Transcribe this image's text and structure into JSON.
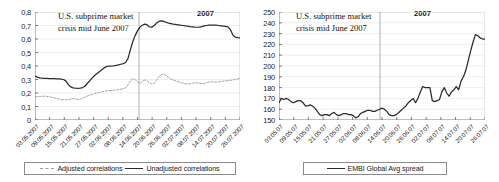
{
  "figure": {
    "panels": [
      {
        "id": "left",
        "annotation_line1": "U.S. subprime market",
        "annotation_line2": "crisis mid June 2007",
        "year_label": "2007",
        "legend": [
          {
            "label": "Adjusted correlations",
            "style": "dashed",
            "color": "#9b9b9b"
          },
          {
            "label": "Unadjusted correlations",
            "style": "solid",
            "color": "#2b2b2b"
          }
        ]
      },
      {
        "id": "right",
        "annotation_line1": "U.S. subprime market",
        "annotation_line2": "crisis mid June 2007",
        "year_label": "2007",
        "legend": [
          {
            "label": "EMBI Global Avg spread",
            "style": "solid",
            "color": "#2b2b2b"
          }
        ]
      }
    ]
  },
  "chart_data": [
    {
      "type": "line",
      "id": "correlations",
      "title": "",
      "xlabel": "",
      "ylabel": "",
      "ylim": [
        0,
        0.8
      ],
      "yticks": [
        0,
        0.1,
        0.2,
        0.3,
        0.4,
        0.5,
        0.6,
        0.7,
        0.8
      ],
      "ytick_labels": [
        "0",
        "0,1",
        "0,2",
        "0,3",
        "0,4",
        "0,5",
        "0,6",
        "0,7",
        "0,8"
      ],
      "grid": true,
      "legend_position": "bottom",
      "annotations": [
        {
          "text": "U.S. subprime market crisis mid June 2007",
          "type": "text"
        },
        {
          "text": "2007",
          "type": "year"
        },
        {
          "type": "vline",
          "at": "18.06.2007"
        }
      ],
      "xtick_labels": [
        "03.05.2007",
        "09.05.2007",
        "15.05.2007",
        "21.05.2007",
        "27.05.2007",
        "02.06.2007",
        "08.06.2007",
        "14.06.2007",
        "20.06.2007",
        "26.06.2007",
        "02.07.2007",
        "08.07.2007",
        "14.07.2007",
        "20.07.2007",
        "26.07.2007"
      ],
      "series": [
        {
          "name": "Unadjusted correlations",
          "color": "#2b2b2b",
          "style": "solid",
          "values": [
            0.325,
            0.318,
            0.312,
            0.31,
            0.309,
            0.308,
            0.307,
            0.306,
            0.306,
            0.305,
            0.304,
            0.303,
            0.3,
            0.288,
            0.262,
            0.245,
            0.238,
            0.236,
            0.235,
            0.236,
            0.24,
            0.252,
            0.272,
            0.292,
            0.312,
            0.33,
            0.345,
            0.358,
            0.372,
            0.386,
            0.396,
            0.4,
            0.4,
            0.401,
            0.404,
            0.408,
            0.413,
            0.418,
            0.426,
            0.455,
            0.52,
            0.58,
            0.625,
            0.66,
            0.688,
            0.702,
            0.71,
            0.706,
            0.69,
            0.688,
            0.7,
            0.718,
            0.73,
            0.734,
            0.73,
            0.724,
            0.718,
            0.714,
            0.71,
            0.708,
            0.705,
            0.702,
            0.7,
            0.697,
            0.695,
            0.692,
            0.69,
            0.688,
            0.687,
            0.688,
            0.692,
            0.697,
            0.7,
            0.702,
            0.703,
            0.703,
            0.702,
            0.7,
            0.698,
            0.696,
            0.694,
            0.688,
            0.668,
            0.63,
            0.614,
            0.61,
            0.609
          ]
        },
        {
          "name": "Adjusted correlations",
          "color": "#9b9b9b",
          "style": "dashed",
          "values": [
            0.172,
            0.174,
            0.175,
            0.176,
            0.176,
            0.175,
            0.172,
            0.168,
            0.164,
            0.16,
            0.156,
            0.152,
            0.15,
            0.149,
            0.152,
            0.156,
            0.158,
            0.155,
            0.152,
            0.155,
            0.162,
            0.17,
            0.178,
            0.185,
            0.19,
            0.196,
            0.2,
            0.204,
            0.208,
            0.212,
            0.216,
            0.218,
            0.219,
            0.22,
            0.222,
            0.225,
            0.228,
            0.232,
            0.238,
            0.26,
            0.29,
            0.306,
            0.3,
            0.282,
            0.272,
            0.288,
            0.296,
            0.292,
            0.276,
            0.264,
            0.272,
            0.296,
            0.32,
            0.336,
            0.34,
            0.33,
            0.316,
            0.304,
            0.296,
            0.29,
            0.284,
            0.278,
            0.272,
            0.268,
            0.266,
            0.268,
            0.272,
            0.276,
            0.276,
            0.272,
            0.268,
            0.27,
            0.276,
            0.282,
            0.284,
            0.282,
            0.28,
            0.282,
            0.286,
            0.288,
            0.29,
            0.292,
            0.294,
            0.296,
            0.3,
            0.304,
            0.308
          ]
        }
      ]
    },
    {
      "type": "line",
      "id": "embi-spread",
      "title": "",
      "xlabel": "",
      "ylabel": "",
      "ylim": [
        150,
        250
      ],
      "yticks": [
        150,
        160,
        170,
        180,
        190,
        200,
        210,
        220,
        230,
        240,
        250
      ],
      "ytick_labels": [
        "150",
        "160",
        "170",
        "180",
        "190",
        "200",
        "210",
        "220",
        "230",
        "240",
        "250"
      ],
      "grid": true,
      "legend_position": "bottom",
      "annotations": [
        {
          "text": "U.S. subprime market crisis mid June 2007",
          "type": "text"
        },
        {
          "text": "2007",
          "type": "year"
        },
        {
          "type": "vline",
          "at": "18.06.07"
        }
      ],
      "xtick_labels": [
        "03.05.07",
        "09.05.07",
        "15.05.07",
        "21.05.07",
        "27.05.07",
        "02.06.07",
        "08.06.07",
        "14.06.07",
        "20.06.07",
        "26.06.07",
        "02.07.07",
        "08.07.07",
        "14.07.07",
        "20.07.07",
        "26.07.07"
      ],
      "series": [
        {
          "name": "EMBI Global Avg spread",
          "color": "#2b2b2b",
          "style": "solid",
          "values": [
            166,
            170,
            169,
            170,
            169,
            167,
            166,
            167,
            168,
            168,
            166,
            163,
            163,
            164,
            163,
            161,
            158,
            155,
            154,
            155,
            155,
            154,
            156,
            157,
            155,
            154,
            155,
            156,
            156,
            155,
            155,
            154,
            152,
            153,
            156,
            157,
            158,
            159,
            159,
            158,
            158,
            159,
            160,
            161,
            160,
            158,
            155,
            154,
            154,
            155,
            157,
            159,
            161,
            163,
            166,
            168,
            170,
            166,
            170,
            176,
            181,
            180,
            180,
            180,
            168,
            167,
            168,
            169,
            176,
            180,
            175,
            172,
            176,
            178,
            181,
            178,
            186,
            190,
            196,
            205,
            214,
            222,
            229,
            228,
            226,
            225,
            225
          ]
        }
      ]
    }
  ]
}
